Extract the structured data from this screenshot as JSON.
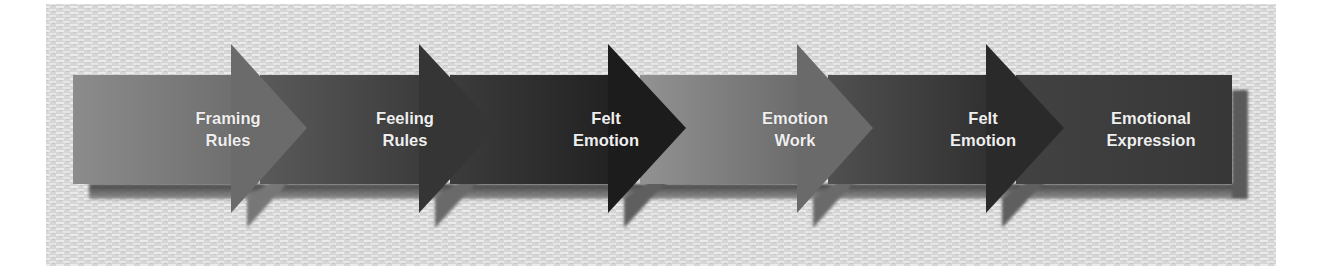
{
  "diagram": {
    "type": "process-flow-arrows",
    "direction": "left-to-right",
    "background": {
      "color": "#dcdcdc",
      "texture": "woven-paper",
      "x": 46,
      "y": 4,
      "width": 1230,
      "height": 262
    },
    "steps": [
      {
        "line1": "Framing",
        "line2": "Rules",
        "center_x": 228,
        "body_start": 73,
        "head_back": 231,
        "head_tip": 307,
        "color_light": "#8c8c8c",
        "color_dark": "#6f6f6f",
        "head_color": "#6b6b6b"
      },
      {
        "line1": "Feeling",
        "line2": "Rules",
        "center_x": 405,
        "body_start": 260,
        "head_back": 419,
        "head_tip": 497,
        "color_light": "#5a5a5a",
        "color_dark": "#3c3c3c",
        "head_color": "#353535"
      },
      {
        "line1": "Felt",
        "line2": "Emotion",
        "center_x": 606,
        "body_start": 450,
        "head_back": 608,
        "head_tip": 686,
        "color_light": "#3c3c3c",
        "color_dark": "#222222",
        "head_color": "#1c1c1c"
      },
      {
        "line1": "Emotion",
        "line2": "Work",
        "center_x": 795,
        "body_start": 640,
        "head_back": 797,
        "head_tip": 873,
        "color_light": "#929292",
        "color_dark": "#6c6c6c",
        "head_color": "#6a6a6a"
      },
      {
        "line1": "Felt",
        "line2": "Emotion",
        "center_x": 983,
        "body_start": 828,
        "head_back": 986,
        "head_tip": 1064,
        "color_light": "#505050",
        "color_dark": "#313131",
        "head_color": "#2a2a2a"
      },
      {
        "line1": "Emotional",
        "line2": "Expression",
        "center_x": 1151,
        "body_start": 1016,
        "body_end": 1232,
        "color_light": "#424242",
        "color_dark": "#373737"
      }
    ],
    "geometry": {
      "body_top": 75,
      "body_bottom": 184,
      "head_top": 44,
      "head_bottom": 213,
      "shadow_dx": 16,
      "shadow_dy": 15
    }
  }
}
